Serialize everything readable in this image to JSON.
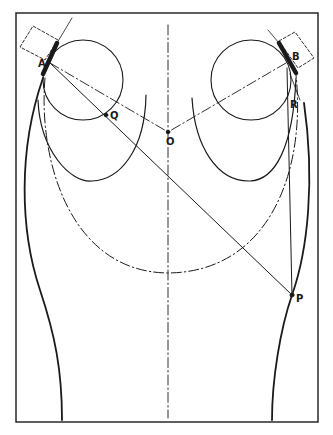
{
  "figure": {
    "colors": {
      "ink": "#1a1a1a",
      "background": "#ffffff"
    },
    "labels": {
      "A": "A",
      "B": "B",
      "Q": "Q",
      "O": "O",
      "R": "R",
      "P": "P"
    },
    "points": {
      "A": [
        50,
        63
      ],
      "B": [
        286,
        63
      ],
      "Q": [
        106,
        115
      ],
      "O": [
        168,
        132
      ],
      "R": [
        289,
        101
      ],
      "P": [
        292,
        295
      ]
    }
  }
}
